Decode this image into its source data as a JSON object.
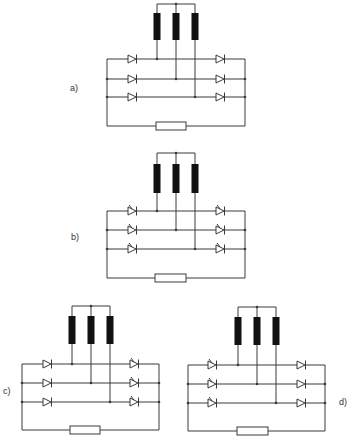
{
  "figure": {
    "colors": {
      "line": "#3a3a3a",
      "coil": "#111111",
      "background": "#ffffff"
    },
    "panels": [
      {
        "id": "a",
        "label": "a)",
        "label_pos": [
          70,
          83
        ],
        "frame": {
          "left": 107,
          "right": 245,
          "rails": [
            59,
            79,
            97
          ],
          "bottom": 126
        },
        "coils": {
          "x": [
            157,
            176,
            195
          ],
          "top_bar": 4,
          "coil_top": 13,
          "coil_bottom": 40
        },
        "resistor": {
          "x": 156,
          "w": 30,
          "y": 122,
          "h": 8
        },
        "left_devices": {
          "x": 128,
          "type": "diode"
        },
        "right_devices": {
          "x": 216,
          "type": "diode"
        }
      },
      {
        "id": "b",
        "label": "b)",
        "label_pos": [
          71,
          232
        ],
        "frame": {
          "left": 107,
          "right": 245,
          "rails": [
            211,
            230,
            249
          ],
          "bottom": 278
        },
        "coils": {
          "x": [
            157,
            176,
            195
          ],
          "top_bar": 153,
          "coil_top": 164,
          "coil_bottom": 193
        },
        "resistor": {
          "x": 155,
          "w": 31,
          "y": 274,
          "h": 8
        },
        "left_devices": {
          "x": 128,
          "type": "thyristor"
        },
        "right_devices": {
          "x": 216,
          "type": "thyristor"
        }
      },
      {
        "id": "c",
        "label": "c)",
        "label_pos": [
          3,
          386
        ],
        "frame": {
          "left": 22,
          "right": 159,
          "rails": [
            364,
            383,
            402
          ],
          "bottom": 430
        },
        "coils": {
          "x": [
            72,
            91,
            110
          ],
          "top_bar": 306,
          "coil_top": 316,
          "coil_bottom": 344
        },
        "resistor": {
          "x": 70,
          "w": 30,
          "y": 426,
          "h": 8
        },
        "left_devices": {
          "x": 43,
          "type": "diode"
        },
        "right_devices": {
          "x": 130,
          "type": "thyristor"
        }
      },
      {
        "id": "d",
        "label": "d)",
        "label_pos": [
          339,
          397
        ],
        "frame": {
          "left": 188,
          "right": 325,
          "rails": [
            365,
            384,
            403
          ],
          "bottom": 431
        },
        "coils": {
          "x": [
            238,
            257,
            276
          ],
          "top_bar": 307,
          "coil_top": 317,
          "coil_bottom": 345
        },
        "resistor": {
          "x": 237,
          "w": 31,
          "y": 427,
          "h": 8
        },
        "left_devices": {
          "x": 208,
          "type": "thyristor"
        },
        "right_devices": {
          "x": 297,
          "type": "diode"
        }
      }
    ]
  }
}
